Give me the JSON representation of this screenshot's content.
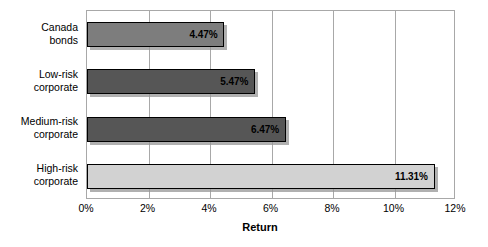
{
  "chart_data": {
    "type": "bar",
    "orientation": "horizontal",
    "title": "",
    "xlabel": "Return",
    "ylabel": "",
    "xlim": [
      0,
      12
    ],
    "xunit": "%",
    "grid": true,
    "legend": false,
    "categories": [
      "Canada\nbonds",
      "Low-risk\ncorporate",
      "Medium-risk\ncorporate",
      "High-risk\ncorporate"
    ],
    "values": [
      4.47,
      5.47,
      6.47,
      11.31
    ],
    "data_labels": [
      "4.47%",
      "5.47%",
      "6.47%",
      "11.31%"
    ],
    "bar_colors": [
      "#7d7d7d",
      "#565656",
      "#565656",
      "#d2d2d2"
    ],
    "xticks": [
      0,
      2,
      4,
      6,
      8,
      10,
      12
    ],
    "xtick_labels": [
      "0%",
      "2%",
      "4%",
      "6%",
      "8%",
      "10%",
      "12%"
    ]
  },
  "style": {
    "bar_border_color": "#000000",
    "gridline_color": "#a8a8a8",
    "plot_border_color": "#a8a8a8",
    "background": "#ffffff",
    "text_color": "#000000"
  }
}
